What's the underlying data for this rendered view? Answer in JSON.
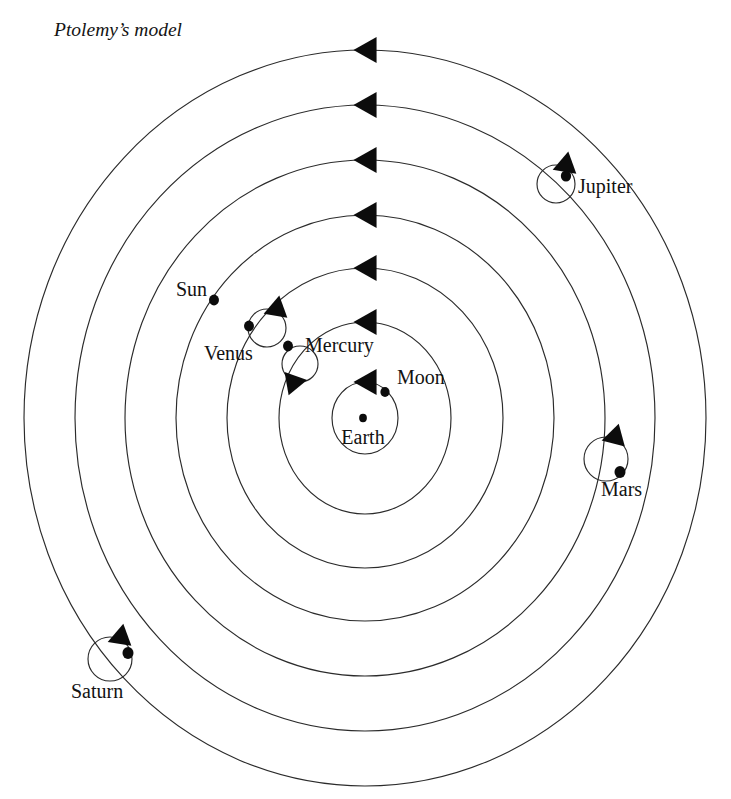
{
  "figure": {
    "cropped_heading_above": "",
    "title": "Ptolemy’s model",
    "center": {
      "x": 365,
      "y": 418
    },
    "earth_dot": {
      "x": 363,
      "y": 418,
      "r": 4.2
    },
    "stroke_color": "#2b2b2b",
    "dot_color": "#0c0c0c",
    "background": "#ffffff"
  },
  "labels": {
    "earth": "Earth",
    "moon": "Moon",
    "mercury": "Mercury",
    "venus": "Venus",
    "sun": "Sun",
    "mars": "Mars",
    "jupiter": "Jupiter",
    "saturn": "Saturn"
  },
  "orbits": [
    {
      "name": "moon",
      "rx": 33,
      "ry": 36,
      "arrow_angle_deg": 270
    },
    {
      "name": "mercury",
      "rx": 86,
      "ry": 96,
      "arrow_angle_deg": 270
    },
    {
      "name": "venus",
      "rx": 138,
      "ry": 150,
      "arrow_angle_deg": 270
    },
    {
      "name": "sun",
      "rx": 189,
      "ry": 203,
      "arrow_angle_deg": 270
    },
    {
      "name": "mars",
      "rx": 240,
      "ry": 258,
      "arrow_angle_deg": 270
    },
    {
      "name": "jupiter",
      "rx": 290,
      "ry": 313,
      "arrow_angle_deg": 270
    },
    {
      "name": "saturn",
      "rx": 341,
      "ry": 368,
      "arrow_angle_deg": 270
    }
  ],
  "bodies": [
    {
      "name": "earth",
      "label": "Earth",
      "has_epicycle": false,
      "dot": {
        "x": 363,
        "y": 418,
        "r": 4.2
      },
      "label_pos": {
        "x": 363,
        "y": 444,
        "anchor": "middle"
      }
    },
    {
      "name": "moon",
      "label": "Moon",
      "has_epicycle": false,
      "dot": {
        "x": 385,
        "y": 392,
        "r": 5.0
      },
      "label_pos": {
        "x": 397,
        "y": 384,
        "anchor": "start"
      }
    },
    {
      "name": "mercury",
      "label": "Mercury",
      "has_epicycle": true,
      "epicycle": {
        "cx": 300,
        "cy": 364,
        "r": 18
      },
      "dot": {
        "x": 288,
        "y": 346,
        "r": 5.4
      },
      "epicycle_arrow_angle_deg": 100,
      "label_pos": {
        "x": 305,
        "y": 352,
        "anchor": "start"
      }
    },
    {
      "name": "venus",
      "label": "Venus",
      "has_epicycle": true,
      "epicycle": {
        "cx": 267,
        "cy": 328,
        "r": 19
      },
      "dot": {
        "x": 249,
        "y": 326,
        "r": 5.4
      },
      "epicycle_arrow_angle_deg": 290,
      "label_pos": {
        "x": 204,
        "y": 360,
        "anchor": "start"
      }
    },
    {
      "name": "sun",
      "label": "Sun",
      "has_epicycle": false,
      "dot": {
        "x": 214,
        "y": 300,
        "r": 5.4
      },
      "label_pos": {
        "x": 176,
        "y": 296,
        "anchor": "start"
      }
    },
    {
      "name": "mars",
      "label": "Mars",
      "has_epicycle": true,
      "epicycle": {
        "cx": 606,
        "cy": 459,
        "r": 22
      },
      "dot": {
        "x": 620,
        "y": 472,
        "r": 6.0
      },
      "epicycle_arrow_angle_deg": 285,
      "label_pos": {
        "x": 601,
        "y": 496,
        "anchor": "start"
      }
    },
    {
      "name": "jupiter",
      "label": "Jupiter",
      "has_epicycle": true,
      "epicycle": {
        "cx": 556,
        "cy": 184,
        "r": 19
      },
      "dot": {
        "x": 566,
        "y": 176,
        "r": 5.6
      },
      "epicycle_arrow_angle_deg": 290,
      "label_pos": {
        "x": 578,
        "y": 193,
        "anchor": "start"
      }
    },
    {
      "name": "saturn",
      "label": "Saturn",
      "has_epicycle": true,
      "epicycle": {
        "cx": 110,
        "cy": 659,
        "r": 22
      },
      "dot": {
        "x": 128,
        "y": 653,
        "r": 6.0
      },
      "epicycle_arrow_angle_deg": 290,
      "label_pos": {
        "x": 71,
        "y": 698,
        "anchor": "start"
      }
    }
  ]
}
